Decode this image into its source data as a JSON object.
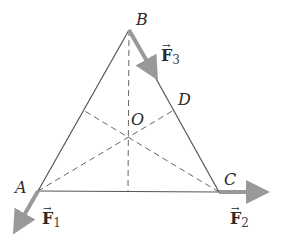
{
  "diagram": {
    "type": "equilateral triangle with forces at vertices",
    "colors": {
      "edge": "#555555",
      "dashed": "#666666",
      "force_arrow": "#999999",
      "label": "#2a2a2a"
    },
    "points": {
      "A": {
        "label": "A",
        "x": 38,
        "y": 191
      },
      "B": {
        "label": "B",
        "x": 129,
        "y": 30
      },
      "C": {
        "label": "C",
        "x": 219,
        "y": 192
      },
      "D": {
        "label": "D",
        "x": 174,
        "y": 110
      },
      "O": {
        "label": "O",
        "x": 128,
        "y": 137
      }
    },
    "forces": [
      {
        "name": "F",
        "sub": "1",
        "at": "A",
        "direction": "down-left"
      },
      {
        "name": "F",
        "sub": "2",
        "at": "C",
        "direction": "right"
      },
      {
        "name": "F",
        "sub": "3",
        "at": "B",
        "direction": "along BC"
      }
    ],
    "vec_symbol": "→"
  }
}
